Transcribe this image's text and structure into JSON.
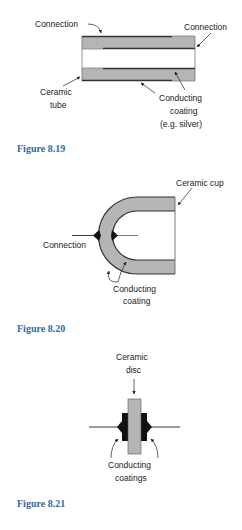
{
  "figures": [
    {
      "caption": "Figure 8.19",
      "labels": {
        "connection_left": "Connection",
        "connection_right": "Connection",
        "ceramic_line1": "Ceramic",
        "ceramic_line2": "tube",
        "coating_line1": "Conducting",
        "coating_line2": "coating",
        "coating_line3": "(e.g. silver)"
      }
    },
    {
      "caption": "Figure 8.20",
      "labels": {
        "ceramic": "Ceramic cup",
        "connection": "Connection",
        "coating_line1": "Conducting",
        "coating_line2": "coating"
      }
    },
    {
      "caption": "Figure 8.21",
      "labels": {
        "ceramic_line1": "Ceramic",
        "ceramic_line2": "disc",
        "coating_line1": "Conducting",
        "coating_line2": "coatings"
      }
    }
  ],
  "colors": {
    "ceramic_fill": "#b5b5b5",
    "outline": "#333333",
    "caption": "#2f6aa3"
  }
}
